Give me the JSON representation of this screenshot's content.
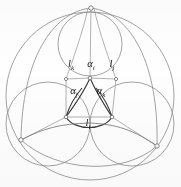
{
  "figure": {
    "kind": "geometric-diagram",
    "background_color": "#fefefe",
    "stroke_color_light": "#8c8c8c",
    "stroke_color_bold": "#3a3a3a",
    "width": 181,
    "height": 187
  },
  "labels": {
    "angle_i": {
      "base": "α",
      "sub": "i",
      "x": 91,
      "y": 65
    },
    "angle_j": {
      "base": "α",
      "sub": "j",
      "x": 74,
      "y": 92
    },
    "angle_k": {
      "base": "α",
      "sub": "k",
      "x": 101,
      "y": 92
    },
    "side_i": {
      "base": "l",
      "sub": "i",
      "x": 88,
      "y": 124
    },
    "side_j": {
      "base": "l",
      "sub": "j",
      "x": 112,
      "y": 65
    },
    "side_k": {
      "base": "l",
      "sub": "k",
      "x": 71,
      "y": 65
    }
  },
  "geometry": {
    "outer_circle": {
      "cx": 90,
      "cy": 96,
      "r": 84
    },
    "inner_circles": [
      {
        "name": "top-circle",
        "cx": 90,
        "cy": 44,
        "r": 31
      },
      {
        "name": "left-circle",
        "cx": 46,
        "cy": 122,
        "r": 31
      },
      {
        "name": "right-circle",
        "cx": 134,
        "cy": 122,
        "r": 31
      }
    ],
    "vertices": [
      {
        "name": "top-vertex",
        "x": 91,
        "y": 8
      },
      {
        "name": "left-vertex",
        "x": 21,
        "y": 140
      },
      {
        "name": "right-vertex",
        "x": 157,
        "y": 146
      },
      {
        "name": "triangle-top",
        "x": 90,
        "y": 78
      },
      {
        "name": "triangle-left",
        "x": 66,
        "y": 117
      },
      {
        "name": "triangle-right",
        "x": 112,
        "y": 117
      },
      {
        "name": "triangle-bottom",
        "x": 89,
        "y": 116
      }
    ]
  }
}
